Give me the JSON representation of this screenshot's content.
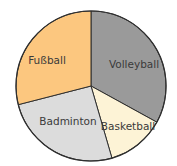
{
  "chart_data": {
    "type": "pie",
    "title": "",
    "start_angle_deg": 0,
    "direction": "clockwise",
    "slices": [
      {
        "label": "Volleyball",
        "value": 33,
        "color": "#9a9a9a"
      },
      {
        "label": "Basketball",
        "value": 12.5,
        "color": "#fdf3d6"
      },
      {
        "label": "Badminton",
        "value": 25.5,
        "color": "#dcdcdc"
      },
      {
        "label": "Fußball",
        "value": 29,
        "color": "#fcc77f"
      }
    ],
    "unit": "%",
    "legend": "none (labels inside slices)"
  }
}
